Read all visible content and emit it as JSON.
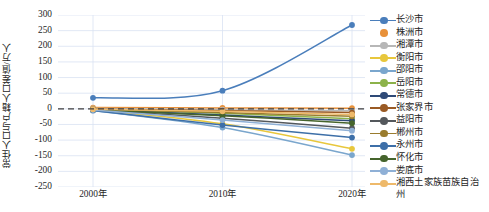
{
  "chart_data": {
    "type": "line",
    "title": "",
    "xlabel": "",
    "ylabel": "常住人口与户籍人口差值/万人",
    "categories": [
      "2000年",
      "2010年",
      "2020年"
    ],
    "x_tick_labels": [
      "2000年",
      "2010年",
      "2020年"
    ],
    "y_tick_labels": [
      "300",
      "250",
      "200",
      "150",
      "100",
      "50",
      "0",
      "-50",
      "-100",
      "-150",
      "-200",
      "-250"
    ],
    "y_tick_values": [
      300,
      250,
      200,
      150,
      100,
      50,
      0,
      -50,
      -100,
      -150,
      -200,
      -250
    ],
    "ylim": [
      -250,
      300
    ],
    "grid": true,
    "legend_position": "right",
    "zero_reference_line": {
      "value": 0,
      "style": "dashed",
      "color": "#3f3f3f"
    },
    "series": [
      {
        "name": "长沙市",
        "color": "#4a7ebb",
        "values": [
          35,
          58,
          268
        ]
      },
      {
        "name": "株洲市",
        "color": "#e8913a",
        "values": [
          4,
          3,
          2
        ]
      },
      {
        "name": "湘潭市",
        "color": "#b7b7b7",
        "values": [
          1,
          -3,
          -6
        ]
      },
      {
        "name": "衡阳市",
        "color": "#e8c73c",
        "values": [
          -3,
          -48,
          -128
        ]
      },
      {
        "name": "邵阳市",
        "color": "#7aa6cd",
        "values": [
          -5,
          -60,
          -148
        ]
      },
      {
        "name": "岳阳市",
        "color": "#8cb24a",
        "values": [
          -2,
          -14,
          -32
        ]
      },
      {
        "name": "常德市",
        "color": "#2e4a77",
        "values": [
          -3,
          -20,
          -38
        ]
      },
      {
        "name": "张家界市",
        "color": "#9a5a24",
        "values": [
          -1,
          -6,
          -12
        ]
      },
      {
        "name": "益阳市",
        "color": "#54585c",
        "values": [
          -4,
          -30,
          -62
        ]
      },
      {
        "name": "郴州市",
        "color": "#9a7c2e",
        "values": [
          -2,
          -12,
          -24
        ]
      },
      {
        "name": "永州市",
        "color": "#3d6fa8",
        "values": [
          -5,
          -52,
          -92
        ]
      },
      {
        "name": "怀化市",
        "color": "#45642c",
        "values": [
          -3,
          -22,
          -46
        ]
      },
      {
        "name": "娄底市",
        "color": "#8fb0d6",
        "values": [
          -4,
          -36,
          -70
        ]
      },
      {
        "name": "湘西土家族苗族自治州",
        "color": "#eeb96a",
        "values": [
          -1,
          -8,
          -18
        ]
      }
    ]
  },
  "legend": {
    "items": [
      {
        "label": "长沙市"
      },
      {
        "label": "株洲市"
      },
      {
        "label": "湘潭市"
      },
      {
        "label": "衡阳市"
      },
      {
        "label": "邵阳市"
      },
      {
        "label": "岳阳市"
      },
      {
        "label": "常德市"
      },
      {
        "label": "张家界市"
      },
      {
        "label": "益阳市"
      },
      {
        "label": "郴州市"
      },
      {
        "label": "永州市"
      },
      {
        "label": "怀化市"
      },
      {
        "label": "娄底市"
      },
      {
        "label": "湘西土家族苗族自治州"
      }
    ]
  },
  "colors": {
    "grid": "#d9e2f3",
    "axis_text": "#262626",
    "background": "#ffffff"
  }
}
